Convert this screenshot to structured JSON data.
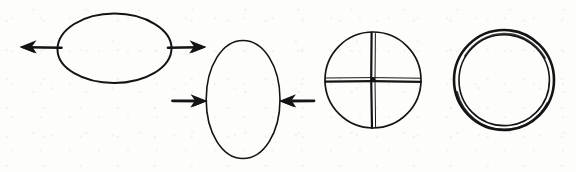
{
  "canvas": {
    "width": 576,
    "height": 172,
    "background_color": "#fdfdfc",
    "ink_color": "#141414",
    "style": "hand-drawn line diagram, no text labels"
  },
  "figures": [
    {
      "id": "figure-1",
      "name": "horizontal-ellipse-with-outward-arrows",
      "description": "Wide horizontal ellipse stretched by two arrows pointing outward (away from the ellipse) along the horizontal major axis",
      "shape": "ellipse",
      "orientation": "horizontal",
      "center": {
        "x": 114,
        "y": 48
      },
      "radius_x": 58,
      "radius_y": 35,
      "stroke_width": 2.0,
      "arrows": [
        {
          "name": "left-outward-arrow",
          "direction": "left",
          "points": "outward",
          "tail": {
            "x": 60,
            "y": 48
          },
          "head": {
            "x": 21,
            "y": 47
          }
        },
        {
          "name": "right-outward-arrow",
          "direction": "right",
          "points": "outward",
          "tail": {
            "x": 168,
            "y": 48
          },
          "head": {
            "x": 205,
            "y": 47
          }
        }
      ]
    },
    {
      "id": "figure-2",
      "name": "vertical-ellipse-with-inward-arrows",
      "description": "Tall vertical ellipse compressed by two arrows pointing inward (toward the ellipse) along the horizontal minor axis",
      "shape": "ellipse",
      "orientation": "vertical",
      "center": {
        "x": 243,
        "y": 99
      },
      "radius_x": 37,
      "radius_y": 59,
      "stroke_width": 1.6,
      "arrows": [
        {
          "name": "left-inward-arrow",
          "direction": "right",
          "points": "inward",
          "tail": {
            "x": 172,
            "y": 101
          },
          "head": {
            "x": 207,
            "y": 101
          }
        },
        {
          "name": "right-inward-arrow",
          "direction": "left",
          "points": "inward",
          "tail": {
            "x": 314,
            "y": 101
          },
          "head": {
            "x": 279,
            "y": 101
          }
        }
      ]
    },
    {
      "id": "figure-3",
      "name": "circle-with-cross",
      "description": "Circle divided into four quadrants by a vertical and a horizontal diameter drawn as doubled hand-drawn lines",
      "shape": "circle-with-cross",
      "center": {
        "x": 373,
        "y": 80
      },
      "radius": 48,
      "stroke_width": 1.7,
      "cross": {
        "vertical_diameter": true,
        "horizontal_diameter": true,
        "line_style": "doubled",
        "center_dot": true
      }
    },
    {
      "id": "figure-4",
      "name": "double-ring-circle",
      "description": "Circle drawn as a thick double ring (annulus) with a heavier outer contour",
      "shape": "annulus",
      "center": {
        "x": 504,
        "y": 80
      },
      "outer_radius": 50,
      "inner_radius": 45,
      "outer_stroke_width": 2.2,
      "inner_stroke_width": 1.4
    }
  ],
  "reading": {
    "sequence": [
      "figure-1",
      "figure-2",
      "figure-3",
      "figure-4"
    ],
    "count": 4,
    "interpretation": "tension (outward arrows) → compression (inward arrows) → quadrant-marked circle → ring"
  }
}
